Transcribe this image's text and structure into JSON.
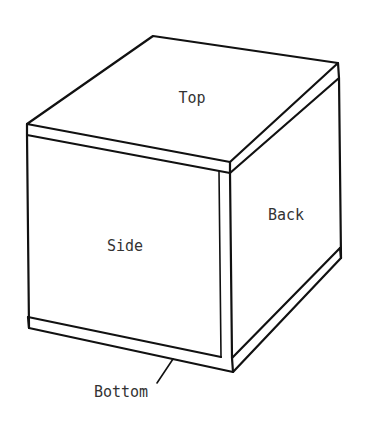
{
  "diagram": {
    "type": "isometric-box-line-drawing",
    "labels": {
      "top": "Top",
      "back": "Back",
      "side": "Side",
      "bottom": "Bottom"
    },
    "colors": {
      "line": "#111111",
      "text": "#333333",
      "background": "#ffffff"
    }
  }
}
